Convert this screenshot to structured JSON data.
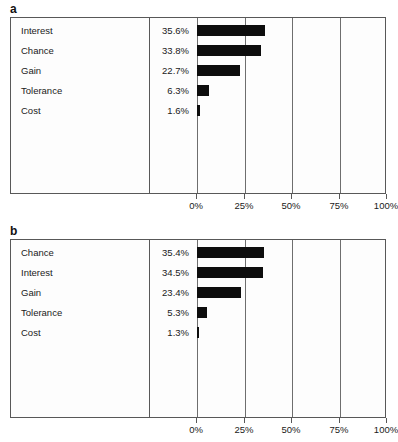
{
  "figure": {
    "panels": [
      {
        "letter": "a",
        "rows": [
          {
            "label": "Interest",
            "value_text": "35.6%",
            "value": 35.6
          },
          {
            "label": "Chance",
            "value_text": "33.8%",
            "value": 33.8
          },
          {
            "label": "Gain",
            "value_text": "22.7%",
            "value": 22.7
          },
          {
            "label": "Tolerance",
            "value_text": "6.3%",
            "value": 6.3
          },
          {
            "label": "Cost",
            "value_text": "1.6%",
            "value": 1.6
          }
        ],
        "axis": {
          "ticks": [
            "0%",
            "25%",
            "50%",
            "75%",
            "100%"
          ],
          "tick_values": [
            0,
            25,
            50,
            75,
            100
          ]
        }
      },
      {
        "letter": "b",
        "rows": [
          {
            "label": "Chance",
            "value_text": "35.4%",
            "value": 35.4
          },
          {
            "label": "Interest",
            "value_text": "34.5%",
            "value": 34.5
          },
          {
            "label": "Gain",
            "value_text": "23.4%",
            "value": 23.4
          },
          {
            "label": "Tolerance",
            "value_text": "5.3%",
            "value": 5.3
          },
          {
            "label": "Cost",
            "value_text": "1.3%",
            "value": 1.3
          }
        ],
        "axis": {
          "ticks": [
            "0%",
            "25%",
            "50%",
            "75%",
            "100%"
          ],
          "tick_values": [
            0,
            25,
            50,
            75,
            100
          ]
        }
      }
    ]
  },
  "chart_data": [
    {
      "type": "bar",
      "orientation": "horizontal",
      "panel": "a",
      "title": "",
      "xlabel": "",
      "ylabel": "",
      "categories": [
        "Interest",
        "Chance",
        "Gain",
        "Tolerance",
        "Cost"
      ],
      "values": [
        35.6,
        33.8,
        22.7,
        6.3,
        1.6
      ],
      "value_labels": [
        "35.6%",
        "33.8%",
        "22.7%",
        "6.3%",
        "1.6%"
      ],
      "xlim": [
        0,
        100
      ],
      "xticks": [
        0,
        25,
        50,
        75,
        100
      ],
      "xticklabels": [
        "0%",
        "25%",
        "50%",
        "75%",
        "100%"
      ],
      "grid": true,
      "legend": null,
      "bar_color": "#0d0d0d"
    },
    {
      "type": "bar",
      "orientation": "horizontal",
      "panel": "b",
      "title": "",
      "xlabel": "",
      "ylabel": "",
      "categories": [
        "Chance",
        "Interest",
        "Gain",
        "Tolerance",
        "Cost"
      ],
      "values": [
        35.4,
        34.5,
        23.4,
        5.3,
        1.3
      ],
      "value_labels": [
        "35.4%",
        "34.5%",
        "23.4%",
        "5.3%",
        "1.3%"
      ],
      "xlim": [
        0,
        100
      ],
      "xticks": [
        0,
        25,
        50,
        75,
        100
      ],
      "xticklabels": [
        "0%",
        "25%",
        "50%",
        "75%",
        "100%"
      ],
      "grid": true,
      "legend": null,
      "bar_color": "#0d0d0d"
    }
  ],
  "style": {
    "bar_color": "#0d0d0d",
    "border_color": "#585858",
    "gridline_color": "#6e6e6e",
    "background": "#fdfdfd"
  }
}
